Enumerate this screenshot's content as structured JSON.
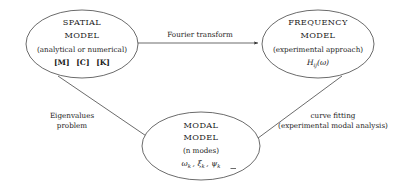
{
  "diagram": {
    "type": "flow-diagram",
    "title": "",
    "background_color": "#ffffff",
    "stroke_color": "#2b2b2b",
    "text_color": "#1a1a1a",
    "nodes": [
      {
        "id": "spatial",
        "shape": "ellipse",
        "title_line1": "SPATIAL",
        "title_line2": "MODEL",
        "subtitle": "(analytical or numerical)",
        "symbols": "[M] [C] [K]",
        "symbol_parts": [
          "[M]",
          "[C]",
          "[K]"
        ]
      },
      {
        "id": "frequency",
        "shape": "ellipse",
        "title_line1": "FREQUENCY",
        "title_line2": "MODEL",
        "subtitle": "(experimental approach)",
        "symbols": "Hij(ω)",
        "symbol_base": "H",
        "symbol_subscript": "ij",
        "symbol_arg": "(ω)"
      },
      {
        "id": "modal",
        "shape": "ellipse",
        "title_line1": "MODAL",
        "title_line2": "MODEL",
        "subtitle": "(n modes)",
        "symbols": "ωk , ξk , ψk",
        "symbol_omega": "ω",
        "symbol_xi": "ξ",
        "symbol_psi": "ψ",
        "symbol_subscript": "k"
      }
    ],
    "edges": [
      {
        "id": "spatial-to-frequency",
        "from": "spatial",
        "to": "frequency",
        "label": "Fourier transform",
        "direction": "right",
        "arrowhead": true
      },
      {
        "id": "spatial-to-modal",
        "from": "spatial",
        "to": "modal",
        "label_line1": "Eigenvalues",
        "label_line2": "problem",
        "direction": "down-right",
        "arrowhead": true
      },
      {
        "id": "frequency-to-modal",
        "from": "frequency",
        "to": "modal",
        "label_line1": "curve fitting",
        "label_line2": "(experimental modal analysis)",
        "direction": "down-left",
        "arrowhead": true
      }
    ]
  }
}
